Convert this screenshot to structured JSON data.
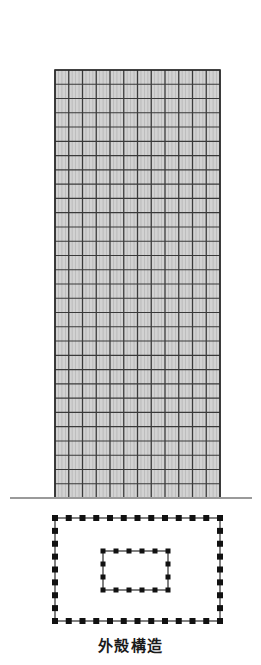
{
  "figure": {
    "caption": "外殻構造",
    "caption_meaning": "outer shell structure",
    "background_color": "#ffffff"
  },
  "elevation": {
    "name": "building-elevation",
    "x": 55,
    "y": 70,
    "width": 165,
    "height": 428,
    "bays": 12,
    "floors": 30,
    "fill_color": "#d2d2d2",
    "major_line_color": "#3a3a3a",
    "minor_line_color": "#8c8c8c",
    "outline_color": "#2b2b2b",
    "minor_mullions_per_bay": 3
  },
  "ground_line": {
    "name": "ground-line",
    "x1": 10,
    "x2": 252,
    "y": 498,
    "color": "#9a9a9a",
    "thickness": 2
  },
  "plan": {
    "name": "floor-plan",
    "outer": {
      "x": 55,
      "y": 518,
      "width": 165,
      "height": 103,
      "columns_top": 13,
      "columns_side": 9,
      "dot_size": 6,
      "line_color": "#1a1a1a",
      "dot_color": "#111111"
    },
    "inner": {
      "x": 103,
      "y": 551,
      "width": 65,
      "height": 39,
      "columns_top": 6,
      "columns_side": 4,
      "dot_size": 5,
      "line_color": "#1a1a1a",
      "dot_color": "#111111"
    }
  }
}
